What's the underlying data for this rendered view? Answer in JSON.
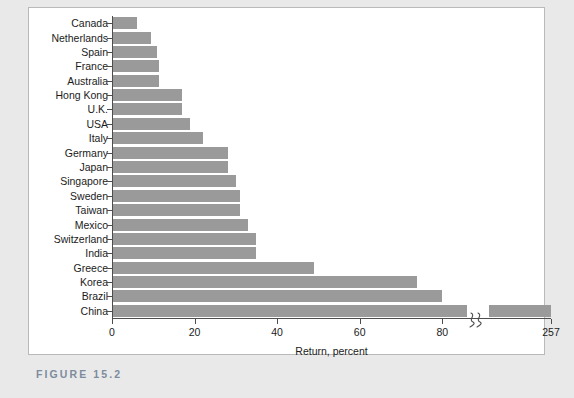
{
  "caption": "FIGURE 15.2",
  "chart_data": {
    "type": "bar",
    "orientation": "horizontal",
    "title": "",
    "xlabel": "Return, percent",
    "ylabel": "",
    "grid": false,
    "legend": false,
    "xlim": [
      0,
      257
    ],
    "xticks": [
      "0",
      "20",
      "40",
      "60",
      "80",
      "257"
    ],
    "xtick_values": [
      0,
      20,
      40,
      60,
      80,
      257
    ],
    "axis_break": {
      "present": true,
      "between": [
        80,
        257
      ],
      "symbol": "squiggle-break"
    },
    "bar_color": "#9a9a9a",
    "categories": [
      "Canada",
      "Netherlands",
      "Spain",
      "France",
      "Australia",
      "Hong Kong",
      "U.K.",
      "USA",
      "Italy",
      "Germany",
      "Japan",
      "Singapore",
      "Sweden",
      "Taiwan",
      "Mexico",
      "Switzerland",
      "India",
      "Greece",
      "Korea",
      "Brazil",
      "China"
    ],
    "values": [
      6,
      9.5,
      11,
      11.5,
      11.5,
      17,
      17,
      19,
      22,
      28,
      28,
      30,
      31,
      31,
      33,
      35,
      35,
      49,
      74,
      80,
      257
    ]
  }
}
